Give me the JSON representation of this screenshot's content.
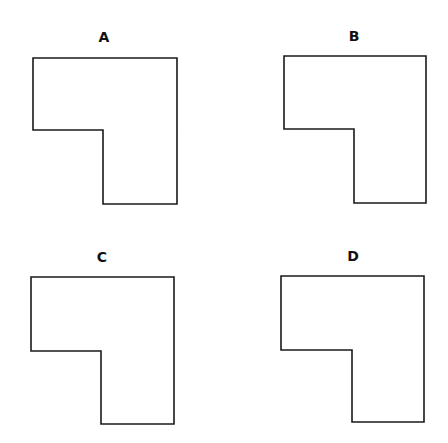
{
  "figure": {
    "panels": [
      {
        "label": "A",
        "points": "33,58 177,58 177,204 103,204 103,130 33,130"
      },
      {
        "label": "B",
        "points": "284,56 426,56 426,203 354,203 354,129 284,129"
      },
      {
        "label": "C",
        "points": "31,277 174,277 174,424 101,424 101,351 31,351"
      },
      {
        "label": "D",
        "points": "281,276 424,276 424,422 352,422 352,350 281,350"
      }
    ]
  }
}
